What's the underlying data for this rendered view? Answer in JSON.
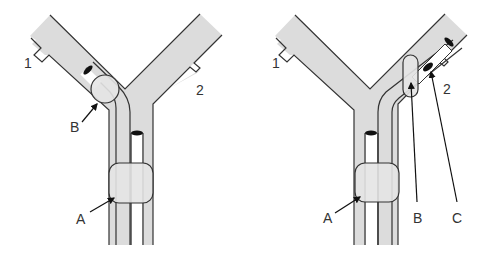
{
  "colors": {
    "pipe_fill": "#dcdcdc",
    "outline": "#333333",
    "balloon_fill": "#e4e4e4",
    "marker": "#111111",
    "background": "#ffffff"
  },
  "diagrams": [
    {
      "id": "left",
      "port_labels": {
        "port1": "1",
        "port2": "2"
      },
      "callouts": {
        "a": "A",
        "b": "B"
      }
    },
    {
      "id": "right",
      "port_labels": {
        "port1": "1",
        "port2": "2"
      },
      "callouts": {
        "a": "A",
        "b": "B",
        "c": "C"
      }
    }
  ]
}
